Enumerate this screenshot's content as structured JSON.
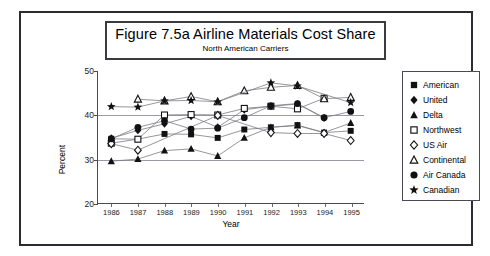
{
  "figure": {
    "title": "Figure 7.5a  Airline Materials Cost Share",
    "subtitle": "North American Carriers"
  },
  "axes": {
    "ylabel": "Percent",
    "xlabel": "Year",
    "yticks": [
      "50",
      "40",
      "30",
      "20"
    ],
    "xticks": [
      "1986",
      "1987",
      "1988",
      "1989",
      "1990",
      "1991",
      "1992",
      "1993",
      "1994",
      "1995"
    ]
  },
  "legend": {
    "items": [
      {
        "label": "American",
        "marker": "filled-square-icon"
      },
      {
        "label": "United",
        "marker": "filled-diamond-icon"
      },
      {
        "label": "Delta",
        "marker": "filled-triangle-icon"
      },
      {
        "label": "Northwest",
        "marker": "open-square-icon"
      },
      {
        "label": "US Air",
        "marker": "open-diamond-icon"
      },
      {
        "label": "Continental",
        "marker": "open-triangle-icon"
      },
      {
        "label": "Air Canada",
        "marker": "filled-circle-icon"
      },
      {
        "label": "Canadian",
        "marker": "filled-star-icon"
      }
    ]
  },
  "colors": {
    "frame": "#2b2b33",
    "axis": "#4a4a52",
    "grid": "#9a9aa2",
    "series_line": "#7a7a82",
    "marker_fill": "#111111",
    "marker_open": "#ffffff",
    "background": "#ffffff"
  },
  "chart_data": {
    "type": "line",
    "title": "Figure 7.5a  Airline Materials Cost Share",
    "subtitle": "North American Carriers",
    "xlabel": "Year",
    "ylabel": "Percent",
    "x": [
      1986,
      1987,
      1988,
      1989,
      1990,
      1991,
      1992,
      1993,
      1994,
      1995
    ],
    "xlim": [
      1985.5,
      1995.5
    ],
    "ylim": [
      20,
      50
    ],
    "yticks": [
      20,
      30,
      40,
      50
    ],
    "grid": "horizontal-at-30-and-40",
    "legend_position": "right-outside",
    "series": [
      {
        "name": "American",
        "marker": "filled-square",
        "values": [
          34.6,
          34.5,
          35.7,
          35.6,
          34.8,
          36.7,
          37.2,
          37.7,
          36.0,
          36.4
        ]
      },
      {
        "name": "United",
        "marker": "filled-diamond",
        "values": [
          34.7,
          36.5,
          38.0,
          39.7,
          37.2,
          41.2,
          42.0,
          42.5,
          39.3,
          null
        ]
      },
      {
        "name": "Delta",
        "marker": "filled-triangle",
        "values": [
          29.5,
          30.0,
          31.9,
          32.3,
          30.7,
          34.8,
          37.2,
          37.6,
          36.0,
          38.2
        ]
      },
      {
        "name": "Northwest",
        "marker": "open-square",
        "values": [
          33.6,
          34.5,
          40.0,
          40.1,
          40.0,
          41.5,
          42.0,
          41.4,
          43.8,
          null
        ]
      },
      {
        "name": "US Air",
        "marker": "open-diamond",
        "values": [
          33.5,
          32.0,
          null,
          null,
          39.9,
          null,
          36.0,
          35.8,
          35.8,
          34.2
        ]
      },
      {
        "name": "Continental",
        "marker": "open-triangle",
        "values": [
          null,
          43.6,
          43.2,
          44.2,
          43.0,
          45.5,
          46.3,
          46.7,
          43.7,
          44.0
        ]
      },
      {
        "name": "Air Canada",
        "marker": "filled-circle",
        "values": [
          34.6,
          37.2,
          38.7,
          36.8,
          37.0,
          39.4,
          42.1,
          42.6,
          39.4,
          40.8
        ]
      },
      {
        "name": "Canadian",
        "marker": "filled-star",
        "values": [
          41.9,
          41.8,
          43.2,
          43.3,
          43.0,
          null,
          47.3,
          46.6,
          null,
          42.8
        ]
      }
    ]
  }
}
